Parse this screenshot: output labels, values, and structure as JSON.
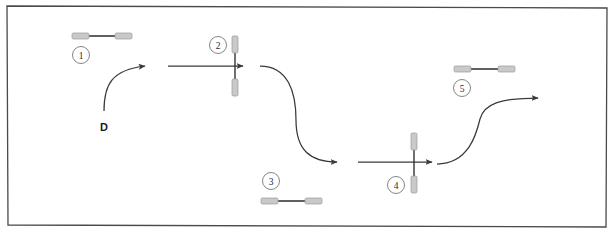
{
  "canvas": {
    "width": 614,
    "height": 239,
    "background_color": "#ffffff",
    "border_color": "#4a4a4a"
  },
  "colors": {
    "stroke_dark": "#3a3a3a",
    "stroke_mid": "#555555",
    "bar_fill": "#c9c9c9",
    "bar_stroke": "#9a9a9a",
    "circle_stroke": "#777777",
    "text": "#2b2b2b"
  },
  "labels": {
    "d_label": "D"
  },
  "markers": [
    {
      "id": "1",
      "label": "1",
      "cx": 81,
      "cy": 55,
      "icon": "dumbbell-horizontal-icon"
    },
    {
      "id": "2",
      "label": "2",
      "cx": 218,
      "cy": 45,
      "icon": "dumbbell-vertical-icon"
    },
    {
      "id": "3",
      "label": "3",
      "cx": 271,
      "cy": 181,
      "icon": "dumbbell-horizontal-icon"
    },
    {
      "id": "4",
      "label": "4",
      "cx": 396,
      "cy": 185,
      "icon": "dumbbell-vertical-icon"
    },
    {
      "id": "5",
      "label": "5",
      "cx": 462,
      "cy": 88,
      "icon": "dumbbell-horizontal-icon"
    }
  ],
  "arrows": [
    {
      "name": "curve-d-to-stage2",
      "kind": "curve"
    },
    {
      "name": "straight-through-marker-2",
      "kind": "straight"
    },
    {
      "name": "s-curve-down-to-lower-path",
      "kind": "curve"
    },
    {
      "name": "straight-through-marker-4",
      "kind": "straight"
    },
    {
      "name": "s-curve-up-to-exit",
      "kind": "curve"
    }
  ]
}
